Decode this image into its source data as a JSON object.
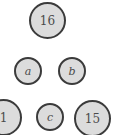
{
  "diagram": {
    "background_color": "#ffffff",
    "node_fill_color": "#dcdcdc",
    "node_border_color": "#3b3b3b",
    "node_text_color": "#4a4a4a",
    "nodes": [
      {
        "id": "node-16",
        "label": "16",
        "kind": "number",
        "row": "top",
        "x": 29,
        "y": 2,
        "size": 37,
        "font_size": 12,
        "clipped": false
      },
      {
        "id": "node-a",
        "label": "a",
        "kind": "letter",
        "row": "middle",
        "x": 14,
        "y": 57,
        "size": 28,
        "font_size": 11,
        "clipped": false
      },
      {
        "id": "node-b",
        "label": "b",
        "kind": "letter",
        "row": "middle",
        "x": 58,
        "y": 57,
        "size": 28,
        "font_size": 11,
        "clipped": false
      },
      {
        "id": "node-1",
        "label": "1",
        "kind": "number",
        "row": "bottom",
        "x": -15,
        "y": 99,
        "size": 37,
        "font_size": 12,
        "clipped": true
      },
      {
        "id": "node-c",
        "label": "c",
        "kind": "letter",
        "row": "bottom",
        "x": 36,
        "y": 103,
        "size": 28,
        "font_size": 11,
        "clipped": false
      },
      {
        "id": "node-15",
        "label": "15",
        "kind": "number",
        "row": "bottom",
        "x": 74,
        "y": 100,
        "size": 37,
        "font_size": 12,
        "clipped": true
      }
    ]
  }
}
